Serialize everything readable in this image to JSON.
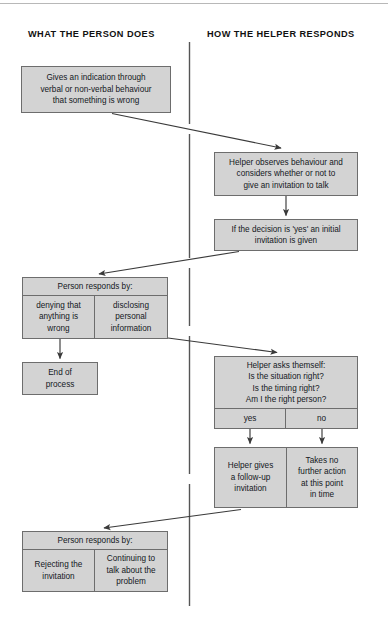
{
  "diagram": {
    "columns": {
      "left_heading": "WHAT THE PERSON DOES",
      "right_heading": "HOW THE HELPER RESPONDS"
    },
    "colors": {
      "box_fill": "#d3d3d3",
      "box_border": "#6d6d6d",
      "text": "#14181d",
      "connector": "#3a3a3a",
      "divider": "#555555",
      "page_background": "#ffffff"
    },
    "nodes": {
      "person_indication": {
        "text": "Gives an indication through\nverbal or non-verbal behaviour\nthat something is wrong"
      },
      "helper_observes": {
        "text": "Helper observes behaviour and\nconsiders whether or not to\ngive an invitation to talk"
      },
      "initial_invitation": {
        "text": "If the decision is 'yes' an initial\ninvitation is given"
      },
      "person_responds_1": {
        "header": "Person responds by:",
        "left_cell": "denying that\nanything is\nwrong",
        "right_cell": "disclosing\npersonal\ninformation"
      },
      "end_of_process": {
        "text": "End of\nprocess"
      },
      "helper_asks": {
        "header": "Helper asks themself:\nIs the situation right?\nIs the timing right?\nAm I the right person?",
        "left_cell": "yes",
        "right_cell": "no"
      },
      "helper_follow_up": {
        "text": "Helper gives\na follow-up\ninvitation"
      },
      "takes_no_action": {
        "text": "Takes no\nfurther action\nat this point\nin time"
      },
      "person_responds_2": {
        "header": "Person responds by:",
        "left_cell": "Rejecting the\ninvitation",
        "right_cell": "Continuing to\ntalk about the\nproblem"
      }
    },
    "connectors": [
      {
        "name": "indication-to-observes",
        "from": "person_indication",
        "to": "helper_observes",
        "style": "diagonal-arrow"
      },
      {
        "name": "observes-to-invitation",
        "from": "helper_observes",
        "to": "initial_invitation",
        "style": "vertical-arrow"
      },
      {
        "name": "invitation-to-responds1",
        "from": "initial_invitation",
        "to": "person_responds_1",
        "style": "diagonal-arrow"
      },
      {
        "name": "denying-to-end",
        "from": "person_responds_1",
        "to": "end_of_process",
        "style": "vertical-arrow"
      },
      {
        "name": "disclosing-to-helper-asks",
        "from": "person_responds_1",
        "to": "helper_asks",
        "style": "diagonal-arrow"
      },
      {
        "name": "yes-to-follow-up",
        "from": "helper_asks",
        "to": "helper_follow_up",
        "style": "vertical-arrow"
      },
      {
        "name": "no-to-no-action",
        "from": "helper_asks",
        "to": "takes_no_action",
        "style": "vertical-arrow"
      },
      {
        "name": "follow-up-to-responds2",
        "from": "helper_follow_up",
        "to": "person_responds_2",
        "style": "diagonal-arrow"
      }
    ]
  }
}
